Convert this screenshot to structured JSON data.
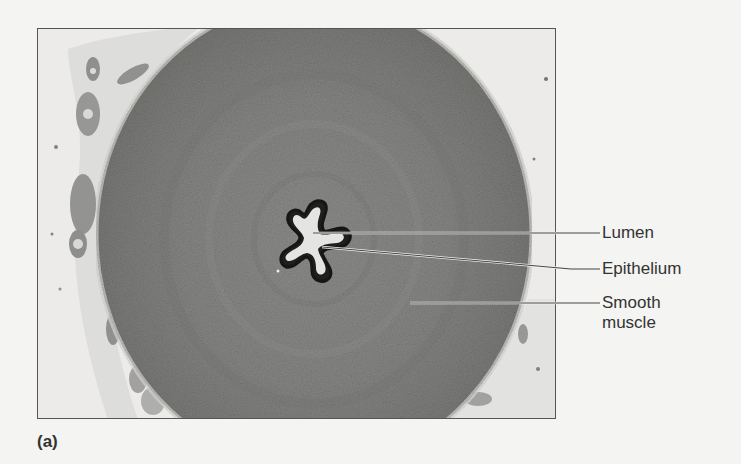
{
  "figure": {
    "panel_letter": "(a)",
    "labels": [
      {
        "id": "lumen",
        "text": "Lumen"
      },
      {
        "id": "epithelium",
        "text": "Epithelium"
      },
      {
        "id": "smooth_muscle",
        "text": "Smooth muscle",
        "line1": "Smooth",
        "line2": "muscle"
      }
    ],
    "colors": {
      "background": "#f4f4f2",
      "muscle": "#8a8a88",
      "muscle_dark": "#6f6f6d",
      "connective_tissue": "#e8e8e6",
      "epithelium": "#1e1e1e",
      "lumen": "#e6e6e4",
      "frame": "#555555",
      "leader_line": "#333333"
    }
  }
}
